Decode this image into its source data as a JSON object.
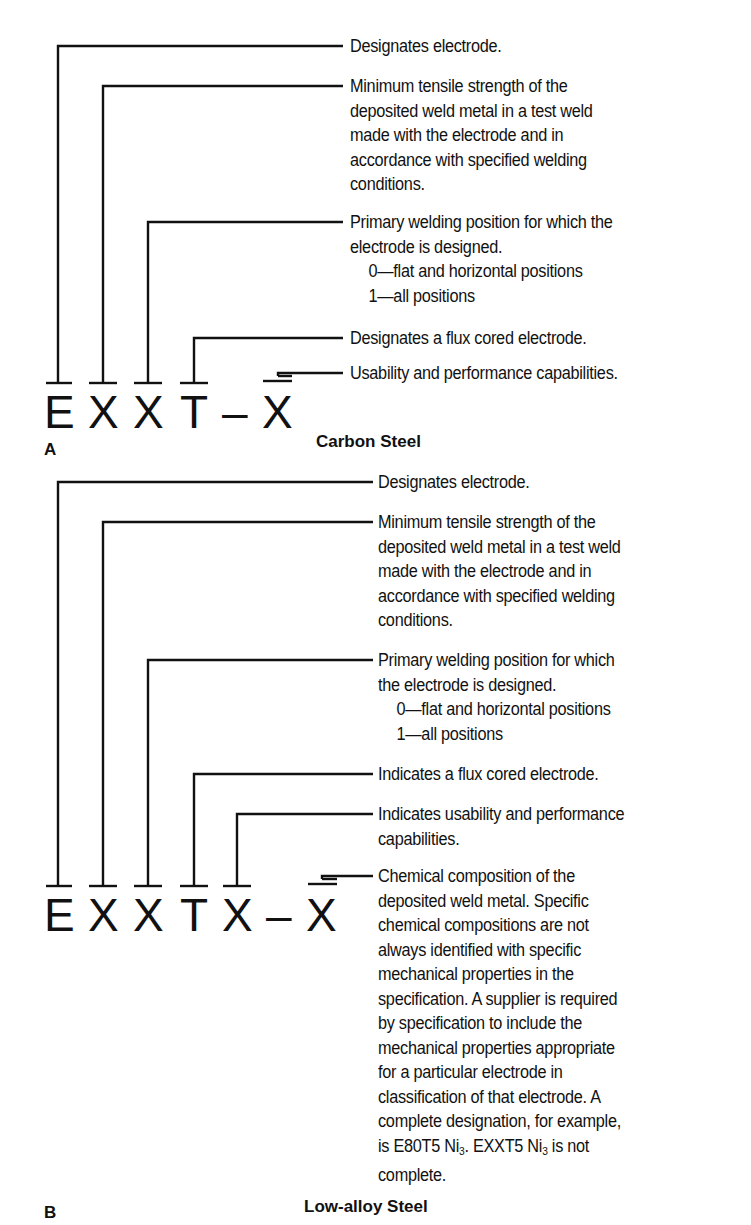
{
  "diagram_a": {
    "label": "A",
    "title": "Carbon Steel",
    "code": [
      "E",
      "X",
      "X",
      "T",
      "–",
      "X"
    ],
    "descriptions": [
      {
        "target": "E",
        "lines": [
          "Designates electrode."
        ]
      },
      {
        "target": "X",
        "lines": [
          "Minimum tensile strength of the",
          "deposited weld metal in a test weld",
          "made with the electrode and in",
          "accordance with specified welding",
          "conditions."
        ]
      },
      {
        "target": "X",
        "lines": [
          "Primary welding position for which the",
          "electrode is designed."
        ],
        "sub_items": [
          "0—flat and horizontal positions",
          "1—all positions"
        ]
      },
      {
        "target": "T",
        "lines": [
          "Designates a flux cored electrode."
        ]
      },
      {
        "target": "X",
        "lines": [
          "Usability and performance capabilities."
        ]
      }
    ]
  },
  "diagram_b": {
    "label": "B",
    "title": "Low-alloy Steel",
    "code": [
      "E",
      "X",
      "X",
      "T",
      "X",
      "–",
      "X"
    ],
    "descriptions": [
      {
        "target": "E",
        "lines": [
          "Designates electrode."
        ]
      },
      {
        "target": "X",
        "lines": [
          "Minimum tensile strength of the",
          "deposited weld metal in a test weld",
          "made with the electrode and in",
          "accordance with specified welding",
          "conditions."
        ]
      },
      {
        "target": "X",
        "lines": [
          "Primary welding position for which",
          "the electrode is designed."
        ],
        "sub_items": [
          "0—flat and horizontal positions",
          "1—all positions"
        ]
      },
      {
        "target": "T",
        "lines": [
          "Indicates a flux cored electrode."
        ]
      },
      {
        "target": "X",
        "lines": [
          "Indicates usability and performance",
          "capabilities."
        ]
      },
      {
        "target": "X",
        "lines": [
          "Chemical composition of the",
          "deposited weld metal. Specific",
          "chemical compositions are not",
          "always identified with specific",
          "mechanical properties in the",
          "specification. A supplier is required",
          "by specification to include the",
          "mechanical properties appropriate",
          "for a particular electrode in",
          "classification of that electrode. A",
          "complete designation, for example,"
        ],
        "tail": {
          "pre": "is E80T5 Ni",
          "sub1": "3",
          "mid": ". EXXT5 Ni",
          "sub2": "3",
          "post": " is not",
          "last": "complete."
        }
      }
    ]
  }
}
